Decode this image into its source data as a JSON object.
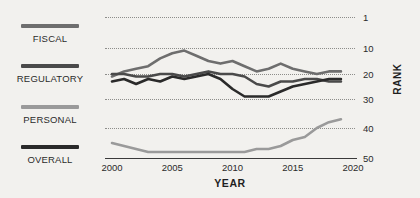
{
  "legend": {
    "items": [
      {
        "label": "FISCAL",
        "color": "#6e6e6e"
      },
      {
        "label": "REGULATORY",
        "color": "#4a4a4a"
      },
      {
        "label": "PERSONAL",
        "color": "#9a9a9a"
      },
      {
        "label": "OVERALL",
        "color": "#2a2a2a"
      }
    ]
  },
  "chart_data": {
    "type": "line",
    "title": "",
    "xlabel": "YEAR",
    "ylabel": "RANK",
    "xlim": [
      2000,
      2020
    ],
    "ylim": [
      1,
      50
    ],
    "y_inverted": true,
    "grid": true,
    "legend_position": "left",
    "xticks": [
      2000,
      2005,
      2010,
      2015,
      2020
    ],
    "yticks": [
      1,
      10,
      20,
      30,
      40,
      50
    ],
    "x": [
      2000,
      2001,
      2002,
      2003,
      2004,
      2005,
      2006,
      2007,
      2008,
      2009,
      2010,
      2011,
      2012,
      2013,
      2014,
      2015,
      2016,
      2017,
      2018,
      2019
    ],
    "series": [
      {
        "name": "FISCAL",
        "color": "#6e6e6e",
        "values": [
          21,
          19,
          18,
          17,
          14,
          12,
          11,
          13,
          15,
          16,
          15,
          17,
          19,
          18,
          16,
          18,
          19,
          20,
          19,
          19
        ]
      },
      {
        "name": "REGULATORY",
        "color": "#4a4a4a",
        "values": [
          20,
          20,
          21,
          21,
          20,
          20,
          21,
          20,
          19,
          20,
          20,
          21,
          24,
          25,
          23,
          23,
          22,
          22,
          23,
          23
        ]
      },
      {
        "name": "PERSONAL",
        "color": "#9a9a9a",
        "values": [
          45,
          46,
          47,
          48,
          48,
          48,
          48,
          48,
          48,
          48,
          48,
          48,
          47,
          47,
          46,
          44,
          43,
          40,
          38,
          37
        ]
      },
      {
        "name": "OVERALL",
        "color": "#2a2a2a",
        "values": [
          23,
          22,
          24,
          22,
          23,
          21,
          22,
          21,
          20,
          22,
          26,
          29,
          29,
          29,
          27,
          25,
          24,
          23,
          22,
          22
        ]
      }
    ]
  }
}
